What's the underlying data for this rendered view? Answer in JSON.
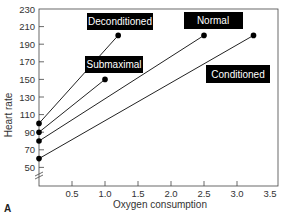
{
  "chart_data": {
    "type": "line",
    "title": "",
    "panel_label": "A",
    "xlabel": "Oxygen consumption",
    "ylabel": "Heart rate",
    "xlim": [
      0,
      3.5
    ],
    "ylim": [
      40,
      230
    ],
    "x_ticks": [
      "0.5",
      "1.0",
      "1.5",
      "2.0",
      "2.5",
      "3.0",
      "3.5"
    ],
    "y_ticks": [
      "230",
      "210",
      "190",
      "170",
      "150",
      "130",
      "110",
      "90",
      "70",
      "50"
    ],
    "grid": false,
    "series": [
      {
        "name": "Deconditioned",
        "points": [
          [
            0,
            100
          ],
          [
            1.2,
            200
          ]
        ]
      },
      {
        "name": "Submaximal",
        "points": [
          [
            0,
            90
          ],
          [
            1.0,
            150
          ]
        ]
      },
      {
        "name": "Normal",
        "points": [
          [
            0,
            80
          ],
          [
            2.5,
            200
          ]
        ]
      },
      {
        "name": "Conditioned",
        "points": [
          [
            0,
            60
          ],
          [
            3.25,
            200
          ]
        ]
      }
    ],
    "annotations": [
      {
        "text": "Deconditioned"
      },
      {
        "text": "Submaximal"
      },
      {
        "text": "Normal"
      },
      {
        "text": "Conditioned"
      }
    ]
  }
}
